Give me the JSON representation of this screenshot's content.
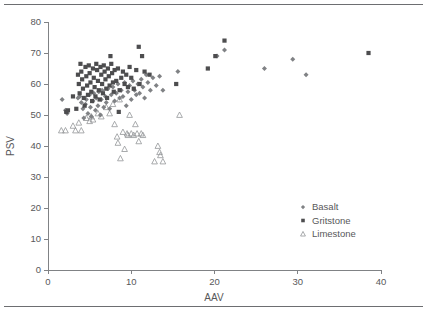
{
  "figure": {
    "top_rule": "horizontal-rule",
    "bottom_rule": "horizontal-rule"
  },
  "chart_data": {
    "type": "scatter",
    "title": "",
    "xlabel": "AAV",
    "ylabel": "PSV",
    "xlim": [
      0,
      40
    ],
    "ylim": [
      0,
      80
    ],
    "xticks": [
      0,
      10,
      20,
      30,
      40
    ],
    "yticks": [
      0,
      10,
      20,
      30,
      40,
      50,
      60,
      70,
      80
    ],
    "xtick_labels": [
      "0",
      "10",
      "20",
      "30",
      "40"
    ],
    "ytick_labels": [
      "0",
      "10",
      "20",
      "30",
      "40",
      "50",
      "60",
      "70",
      "80"
    ],
    "grid": false,
    "legend_position": "lower-right",
    "colors": {
      "basalt": "#808285",
      "gritstone": "#4d4d4f",
      "limestone": "#939598",
      "axis": "#808285",
      "text": "#58585a",
      "rule": "#6d6e71"
    },
    "series": [
      {
        "name": "Basalt",
        "marker": "diamond",
        "color": "#808285",
        "points": [
          [
            1.7,
            55.0
          ],
          [
            2.1,
            51.5
          ],
          [
            2.2,
            51.0
          ],
          [
            2.3,
            50.5
          ],
          [
            3.6,
            55.5
          ],
          [
            3.8,
            56.0
          ],
          [
            4.0,
            54.0
          ],
          [
            4.2,
            52.0
          ],
          [
            4.3,
            49.0
          ],
          [
            4.5,
            53.5
          ],
          [
            4.6,
            55.0
          ],
          [
            4.8,
            50.5
          ],
          [
            5.0,
            56.5
          ],
          [
            5.1,
            52.5
          ],
          [
            5.2,
            49.5
          ],
          [
            5.4,
            54.5
          ],
          [
            5.5,
            57.0
          ],
          [
            5.7,
            51.5
          ],
          [
            5.8,
            55.5
          ],
          [
            6.0,
            53.0
          ],
          [
            6.1,
            57.5
          ],
          [
            6.3,
            50.0
          ],
          [
            6.4,
            55.0
          ],
          [
            6.5,
            58.0
          ],
          [
            6.7,
            52.5
          ],
          [
            6.9,
            56.0
          ],
          [
            7.0,
            54.0
          ],
          [
            7.2,
            58.5
          ],
          [
            7.4,
            52.0
          ],
          [
            7.6,
            56.5
          ],
          [
            7.8,
            59.0
          ],
          [
            8.0,
            54.5
          ],
          [
            8.2,
            57.0
          ],
          [
            8.4,
            60.0
          ],
          [
            8.6,
            55.5
          ],
          [
            8.8,
            58.0
          ],
          [
            9.0,
            56.0
          ],
          [
            9.2,
            60.5
          ],
          [
            9.4,
            53.0
          ],
          [
            9.6,
            57.5
          ],
          [
            9.8,
            59.5
          ],
          [
            10.0,
            55.0
          ],
          [
            10.2,
            61.0
          ],
          [
            10.4,
            58.0
          ],
          [
            10.6,
            56.5
          ],
          [
            10.8,
            60.0
          ],
          [
            11.0,
            57.0
          ],
          [
            11.2,
            61.5
          ],
          [
            11.4,
            59.0
          ],
          [
            11.6,
            55.5
          ],
          [
            11.8,
            63.0
          ],
          [
            12.0,
            60.5
          ],
          [
            12.3,
            58.0
          ],
          [
            12.6,
            62.0
          ],
          [
            13.0,
            59.5
          ],
          [
            13.4,
            62.5
          ],
          [
            13.8,
            58.0
          ],
          [
            15.6,
            64.0
          ],
          [
            20.3,
            69.0
          ],
          [
            21.2,
            71.0
          ],
          [
            26.0,
            65.0
          ],
          [
            29.4,
            68.0
          ],
          [
            31.0,
            63.0
          ]
        ]
      },
      {
        "name": "Gritstone",
        "marker": "square",
        "color": "#4d4d4f",
        "points": [
          [
            2.2,
            51.0
          ],
          [
            2.4,
            51.5
          ],
          [
            3.0,
            56.0
          ],
          [
            3.4,
            52.0
          ],
          [
            3.6,
            63.0
          ],
          [
            3.7,
            60.0
          ],
          [
            3.8,
            57.0
          ],
          [
            3.9,
            66.5
          ],
          [
            4.0,
            64.0
          ],
          [
            4.1,
            61.5
          ],
          [
            4.2,
            58.5
          ],
          [
            4.3,
            55.5
          ],
          [
            4.4,
            53.0
          ],
          [
            4.5,
            65.5
          ],
          [
            4.6,
            62.5
          ],
          [
            4.7,
            59.5
          ],
          [
            4.8,
            56.5
          ],
          [
            4.9,
            66.0
          ],
          [
            5.0,
            63.5
          ],
          [
            5.1,
            60.5
          ],
          [
            5.2,
            57.5
          ],
          [
            5.3,
            54.5
          ],
          [
            5.4,
            65.0
          ],
          [
            5.5,
            62.0
          ],
          [
            5.6,
            59.0
          ],
          [
            5.7,
            56.0
          ],
          [
            5.8,
            66.5
          ],
          [
            5.9,
            64.5
          ],
          [
            6.0,
            61.0
          ],
          [
            6.1,
            58.0
          ],
          [
            6.2,
            55.0
          ],
          [
            6.3,
            65.5
          ],
          [
            6.4,
            63.0
          ],
          [
            6.5,
            60.0
          ],
          [
            6.6,
            57.0
          ],
          [
            6.7,
            66.0
          ],
          [
            6.8,
            64.0
          ],
          [
            6.9,
            61.5
          ],
          [
            7.0,
            58.5
          ],
          [
            7.1,
            55.5
          ],
          [
            7.2,
            65.0
          ],
          [
            7.3,
            62.5
          ],
          [
            7.4,
            59.5
          ],
          [
            7.5,
            69.0
          ],
          [
            7.6,
            66.5
          ],
          [
            7.7,
            63.5
          ],
          [
            7.8,
            60.5
          ],
          [
            7.9,
            57.5
          ],
          [
            8.0,
            64.5
          ],
          [
            8.2,
            61.0
          ],
          [
            8.4,
            65.0
          ],
          [
            8.5,
            51.0
          ],
          [
            8.6,
            58.0
          ],
          [
            8.8,
            62.0
          ],
          [
            9.0,
            64.0
          ],
          [
            9.2,
            60.0
          ],
          [
            9.4,
            63.0
          ],
          [
            9.6,
            59.0
          ],
          [
            9.8,
            65.5
          ],
          [
            10.0,
            62.0
          ],
          [
            10.3,
            58.5
          ],
          [
            10.6,
            64.5
          ],
          [
            10.9,
            72.0
          ],
          [
            11.0,
            60.0
          ],
          [
            11.3,
            69.0
          ],
          [
            11.6,
            64.0
          ],
          [
            12.2,
            63.0
          ],
          [
            15.4,
            60.0
          ],
          [
            19.2,
            65.0
          ],
          [
            20.1,
            69.0
          ],
          [
            21.2,
            74.0
          ],
          [
            38.5,
            70.0
          ]
        ]
      },
      {
        "name": "Limestone",
        "marker": "triangle",
        "color": "#939598",
        "points": [
          [
            1.6,
            45.0
          ],
          [
            2.1,
            45.0
          ],
          [
            3.0,
            46.5
          ],
          [
            3.3,
            45.0
          ],
          [
            3.7,
            47.5
          ],
          [
            4.0,
            45.0
          ],
          [
            4.6,
            49.0
          ],
          [
            5.0,
            48.0
          ],
          [
            5.2,
            49.5
          ],
          [
            5.4,
            48.5
          ],
          [
            6.0,
            50.5
          ],
          [
            6.4,
            49.5
          ],
          [
            7.0,
            52.5
          ],
          [
            7.4,
            50.5
          ],
          [
            7.8,
            53.5
          ],
          [
            8.0,
            47.0
          ],
          [
            8.3,
            43.0
          ],
          [
            8.4,
            41.0
          ],
          [
            8.6,
            55.0
          ],
          [
            8.7,
            36.0
          ],
          [
            9.0,
            44.5
          ],
          [
            9.2,
            39.0
          ],
          [
            9.5,
            44.0
          ],
          [
            9.6,
            43.5
          ],
          [
            9.8,
            50.0
          ],
          [
            10.0,
            44.0
          ],
          [
            10.3,
            43.5
          ],
          [
            10.5,
            47.0
          ],
          [
            10.7,
            44.0
          ],
          [
            10.9,
            41.5
          ],
          [
            11.2,
            44.0
          ],
          [
            11.4,
            43.5
          ],
          [
            12.8,
            35.0
          ],
          [
            13.2,
            40.0
          ],
          [
            13.4,
            38.0
          ],
          [
            13.5,
            37.0
          ],
          [
            13.8,
            35.0
          ],
          [
            15.8,
            50.0
          ]
        ]
      }
    ]
  },
  "legend": {
    "items": [
      {
        "label": "Basalt",
        "marker": "diamond",
        "color": "#808285"
      },
      {
        "label": "Gritstone",
        "marker": "square",
        "color": "#4d4d4f"
      },
      {
        "label": "Limestone",
        "marker": "triangle",
        "color": "#939598"
      }
    ]
  }
}
